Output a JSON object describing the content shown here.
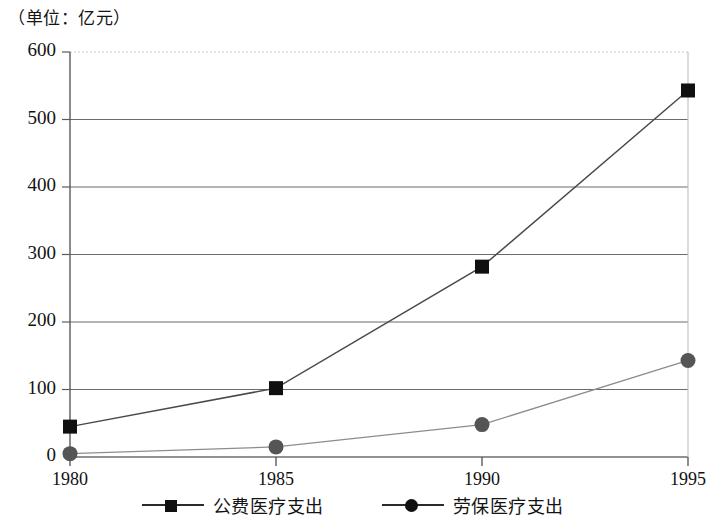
{
  "unit_note": "（单位：亿元）",
  "chart_data": {
    "type": "line",
    "title": "",
    "subtitle": "",
    "unit_label": "（单位：亿元）",
    "xlabel": "",
    "ylabel": "",
    "categories": [
      "1980",
      "1985",
      "1990",
      "1995"
    ],
    "x_tick_labels": [
      "1980",
      "1985",
      "1990",
      "1995"
    ],
    "y_tick_labels": [
      "0",
      "100",
      "200",
      "300",
      "400",
      "500",
      "600"
    ],
    "y_ticks": [
      0,
      100,
      200,
      300,
      400,
      500,
      600
    ],
    "ylim": [
      0,
      600
    ],
    "grid": true,
    "grid_axis": "y",
    "legend_position": "bottom",
    "series": [
      {
        "name": "公费医疗支出",
        "marker": "square",
        "color": "#101010",
        "values": [
          45,
          102,
          282,
          543
        ]
      },
      {
        "name": "劳保医疗支出",
        "marker": "circle",
        "color": "#555555",
        "values": [
          5,
          15,
          48,
          143
        ]
      }
    ]
  },
  "legend": {
    "items": [
      {
        "label": "公费医疗支出",
        "marker": "square-marker-icon"
      },
      {
        "label": "劳保医疗支出",
        "marker": "circle-marker-icon"
      }
    ]
  }
}
